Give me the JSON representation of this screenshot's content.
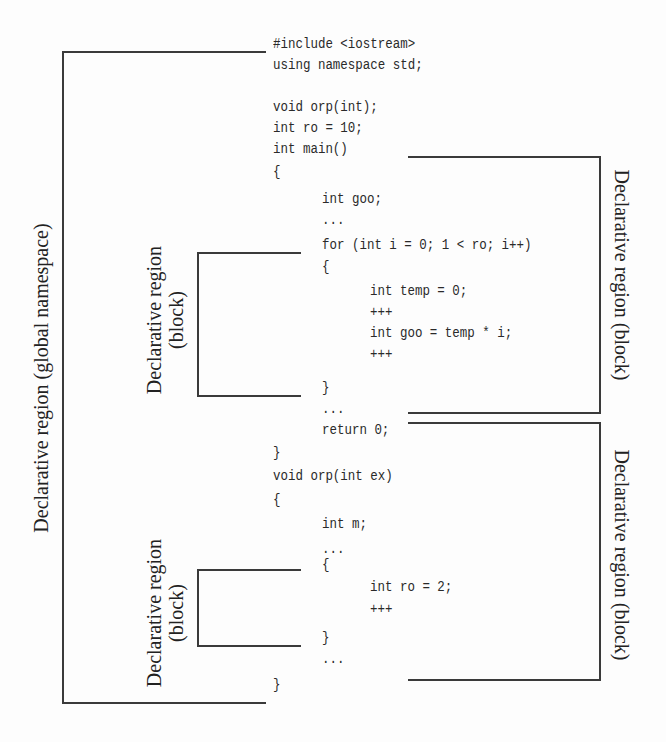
{
  "code": {
    "lines": [
      {
        "text": "#include <iostream>",
        "x": 273,
        "y": 44
      },
      {
        "text": "using namespace std;",
        "x": 273,
        "y": 65
      },
      {
        "text": "void orp(int);",
        "x": 273,
        "y": 107
      },
      {
        "text": "int ro = 10;",
        "x": 273,
        "y": 128
      },
      {
        "text": "int main()",
        "x": 273,
        "y": 149
      },
      {
        "text": "{",
        "x": 273,
        "y": 172
      },
      {
        "text": "int goo;",
        "x": 322,
        "y": 199
      },
      {
        "text": "...",
        "x": 322,
        "y": 220
      },
      {
        "text": "for (int i = 0; 1 < ro; i++)",
        "x": 322,
        "y": 245
      },
      {
        "text": "{",
        "x": 322,
        "y": 267
      },
      {
        "text": "int temp = 0;",
        "x": 370,
        "y": 291
      },
      {
        "text": "+++",
        "x": 370,
        "y": 312
      },
      {
        "text": "int goo = temp * i;",
        "x": 370,
        "y": 333
      },
      {
        "text": "+++",
        "x": 370,
        "y": 354
      },
      {
        "text": "}",
        "x": 322,
        "y": 388
      },
      {
        "text": "...",
        "x": 322,
        "y": 409
      },
      {
        "text": "return 0;",
        "x": 322,
        "y": 430
      },
      {
        "text": "}",
        "x": 273,
        "y": 453
      },
      {
        "text": "void orp(int ex)",
        "x": 273,
        "y": 476
      },
      {
        "text": "{",
        "x": 273,
        "y": 500
      },
      {
        "text": "int m;",
        "x": 322,
        "y": 524
      },
      {
        "text": "...",
        "x": 322,
        "y": 549
      },
      {
        "text": "{",
        "x": 322,
        "y": 565
      },
      {
        "text": "int ro = 2;",
        "x": 370,
        "y": 587
      },
      {
        "text": "+++",
        "x": 370,
        "y": 609
      },
      {
        "text": "}",
        "x": 322,
        "y": 638
      },
      {
        "text": "...",
        "x": 322,
        "y": 659
      },
      {
        "text": "}",
        "x": 273,
        "y": 685
      }
    ]
  },
  "labels": {
    "global": "Declarative region (global namespace)",
    "block_left_top_line1": "Declarative region",
    "block_left_top_line2": "(block)",
    "block_left_bottom_line1": "Declarative region",
    "block_left_bottom_line2": "(block)",
    "block_right_top": "Declarative region (block)",
    "block_right_bottom": "Declarative region (block)"
  },
  "colors": {
    "line": "#3a3a3a",
    "text": "#222222",
    "background": "#fdfdfd"
  }
}
